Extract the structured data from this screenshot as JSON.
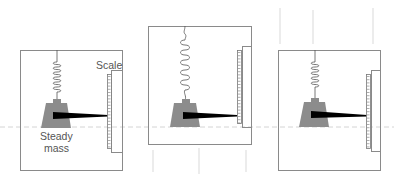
{
  "diagram": {
    "type": "spring-balance-in-elevator",
    "labels": {
      "scale": "Scale",
      "mass_line1": "Steady",
      "mass_line2": "mass"
    },
    "colors": {
      "frame": "#8a8a8a",
      "mass": "#8c8c8c",
      "pointer": "#000000",
      "spring": "#555555",
      "reference_line": "#cfcfcf",
      "motion_lines": "#e4e4e4"
    },
    "panels": [
      {
        "id": "at-rest",
        "spring_state": "normal",
        "motion": "none"
      },
      {
        "id": "accelerating-up",
        "spring_state": "stretched",
        "motion": "lines-below"
      },
      {
        "id": "accelerating-down",
        "spring_state": "compressed",
        "motion": "lines-above"
      }
    ]
  }
}
